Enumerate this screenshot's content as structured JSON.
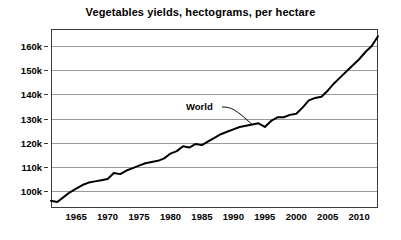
{
  "chart_data": {
    "type": "line",
    "title": "Vegetables yields, hectograms, per hectare",
    "xlabel": "",
    "ylabel": "",
    "grid": true,
    "legend_position": "inline-annotation",
    "xlim": [
      1961,
      2013
    ],
    "ylim": [
      93000,
      167000
    ],
    "y_ticks": [
      100000,
      110000,
      120000,
      130000,
      140000,
      150000,
      160000
    ],
    "y_tick_labels": [
      "100k",
      "110k",
      "120k",
      "130k",
      "140k",
      "150k",
      "160k"
    ],
    "x_ticks": [
      1965,
      1970,
      1975,
      1980,
      1985,
      1990,
      1995,
      2000,
      2005,
      2010
    ],
    "x_tick_labels": [
      "1965",
      "1970",
      "1975",
      "1980",
      "1985",
      "1990",
      "1995",
      "2000",
      "2005",
      "2010"
    ],
    "series": [
      {
        "name": "World",
        "color": "#000000",
        "annotation_label": "World",
        "x": [
          1961,
          1962,
          1963,
          1964,
          1965,
          1966,
          1967,
          1968,
          1969,
          1970,
          1971,
          1972,
          1973,
          1974,
          1975,
          1976,
          1977,
          1978,
          1979,
          1980,
          1981,
          1982,
          1983,
          1984,
          1985,
          1986,
          1987,
          1988,
          1989,
          1990,
          1991,
          1992,
          1993,
          1994,
          1995,
          1996,
          1997,
          1998,
          1999,
          2000,
          2001,
          2002,
          2003,
          2004,
          2005,
          2006,
          2007,
          2008,
          2009,
          2010,
          2011,
          2012,
          2013
        ],
        "values": [
          96000,
          95500,
          97500,
          99500,
          101000,
          102500,
          103500,
          104000,
          104500,
          105000,
          107500,
          107000,
          108500,
          109500,
          110500,
          111500,
          112000,
          112500,
          113500,
          115500,
          116500,
          118500,
          118000,
          119500,
          119000,
          120500,
          122000,
          123500,
          124500,
          125500,
          126500,
          127000,
          127500,
          128000,
          126500,
          129000,
          130500,
          130500,
          131500,
          132000,
          134500,
          137500,
          138500,
          139000,
          141500,
          144500,
          147000,
          149500,
          152000,
          154500,
          157500,
          160000,
          164000
        ]
      }
    ]
  },
  "annotation": {
    "world_label": "World"
  }
}
